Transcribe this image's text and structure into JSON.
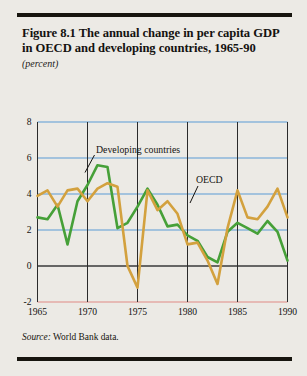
{
  "figure": {
    "title": "Figure 8.1  The annual change in per capita GDP in OECD and developing countries, 1965-90",
    "units": "(percent)",
    "source_label": "Source:",
    "source_text": "World Bank data."
  },
  "labels": {
    "developing": "Developing countries",
    "oecd": "OECD"
  },
  "colors": {
    "developing": "#46a038",
    "oecd": "#d3a13e",
    "gridline_positive": "#5b9bd5",
    "gridline_zero": "#3a3a3a",
    "gridline_negative": "#e08a86",
    "axis": "#2b2b2b",
    "background": "#eceae5",
    "rule": "#17150f"
  },
  "chart_data": {
    "type": "line",
    "title": "Figure 8.1  The annual change in per capita GDP in OECD and developing countries, 1965-90",
    "xlabel": "",
    "ylabel": "(percent)",
    "xlim": [
      1965,
      1990
    ],
    "ylim": [
      -2,
      8
    ],
    "yticks": [
      -2,
      0,
      2,
      4,
      6,
      8
    ],
    "xticks": [
      1965,
      1970,
      1975,
      1980,
      1985,
      1990
    ],
    "grid": true,
    "legend": "inline-annotations",
    "x": [
      1965,
      1966,
      1967,
      1968,
      1969,
      1970,
      1971,
      1972,
      1973,
      1974,
      1975,
      1976,
      1977,
      1978,
      1979,
      1980,
      1981,
      1982,
      1983,
      1984,
      1985,
      1986,
      1987,
      1988,
      1989,
      1990
    ],
    "series": [
      {
        "name": "Developing countries",
        "color": "#46a038",
        "values": [
          2.7,
          2.6,
          3.4,
          1.2,
          3.6,
          4.5,
          5.6,
          5.5,
          2.1,
          2.4,
          3.3,
          4.3,
          3.4,
          2.2,
          2.3,
          1.7,
          1.4,
          0.5,
          0.2,
          1.9,
          2.4,
          2.1,
          1.8,
          2.5,
          1.9,
          0.3
        ]
      },
      {
        "name": "OECD",
        "color": "#d3a13e",
        "values": [
          3.9,
          4.2,
          3.3,
          4.2,
          4.3,
          3.6,
          4.3,
          4.6,
          4.4,
          0.0,
          -1.2,
          4.2,
          3.1,
          3.6,
          2.9,
          1.2,
          1.3,
          0.3,
          -1.0,
          2.1,
          4.2,
          2.7,
          2.6,
          3.3,
          4.3,
          2.7
        ]
      }
    ]
  }
}
